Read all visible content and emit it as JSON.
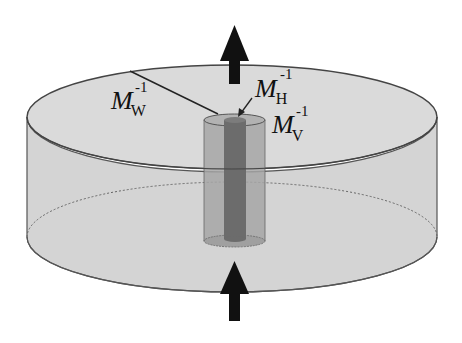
{
  "diagram": {
    "labels": {
      "mw": {
        "base": "M",
        "sub": "W",
        "sup": "-1"
      },
      "mh": {
        "base": "M",
        "sub": "H",
        "sup": "-1"
      },
      "mv": {
        "base": "M",
        "sub": "V",
        "sup": "-1"
      }
    },
    "colors": {
      "disk_fill": "#d6d6d6",
      "disk_edge": "#555555",
      "outer_cylinder": "#9a9a9a",
      "inner_core": "#6a6a6a",
      "arrow": "#111111"
    }
  }
}
